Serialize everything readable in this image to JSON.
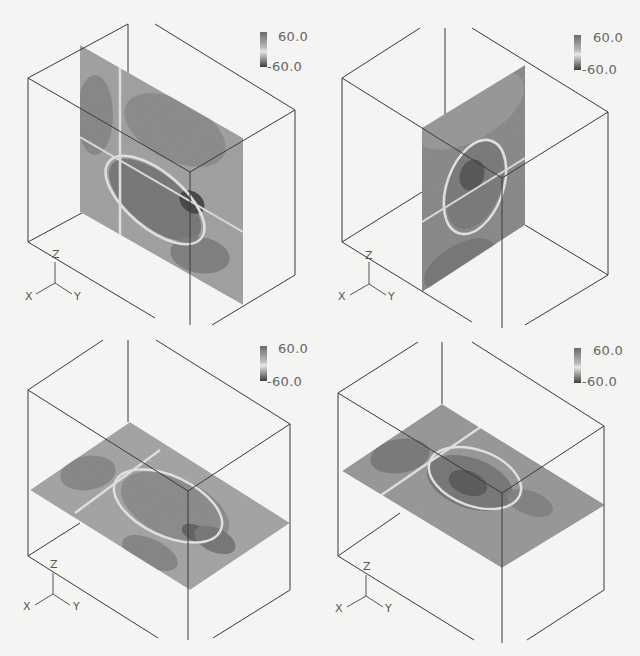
{
  "figure": {
    "panels": [
      {
        "id": "a",
        "slice_orientation": "vertical (x-z plane)",
        "colorbar": {
          "max_label": "60.0",
          "min_label": "-60.0"
        },
        "axes": {
          "x": "X",
          "y": "Y",
          "z": "Z"
        }
      },
      {
        "id": "b",
        "slice_orientation": "vertical (y-z plane)",
        "colorbar": {
          "max_label": "60.0",
          "min_label": "-60.0"
        },
        "axes": {
          "x": "X",
          "y": "Y",
          "z": "Z"
        }
      },
      {
        "id": "c",
        "slice_orientation": "horizontal (x-y plane)",
        "colorbar": {
          "max_label": "60.0",
          "min_label": "-60.0"
        },
        "axes": {
          "x": "X",
          "y": "Y",
          "z": "Z"
        }
      },
      {
        "id": "d",
        "slice_orientation": "horizontal (x-y plane)",
        "colorbar": {
          "max_label": "60.0",
          "min_label": "-60.0"
        },
        "axes": {
          "x": "X",
          "y": "Y",
          "z": "Z"
        }
      }
    ],
    "colors": {
      "background": "#f4f4f2",
      "box_edge": "#3a3a3a",
      "slice_base": "#9a9a9a",
      "slice_dark": "#555555",
      "contour_zero": "#e6e6e6"
    },
    "colorbar_range": [
      -60.0,
      60.0
    ]
  }
}
